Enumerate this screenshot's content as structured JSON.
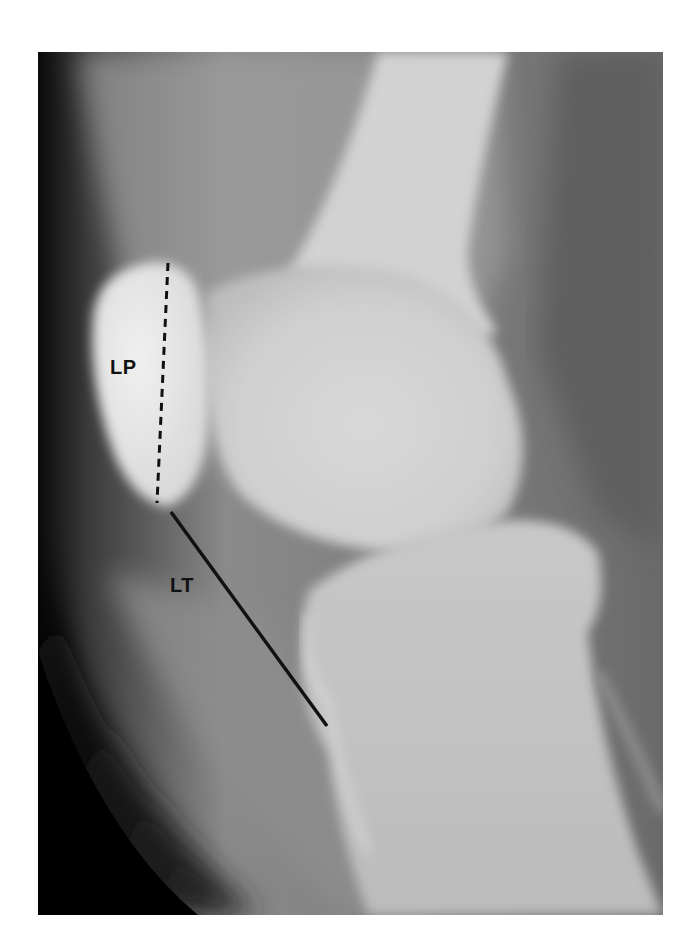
{
  "figure": {
    "type": "lateral knee radiograph",
    "labels": {
      "patella_length": "LP",
      "tendon_length": "LT"
    },
    "lines": {
      "patella_length": {
        "style": "dashed",
        "x1": 168,
        "y1": 263,
        "x2": 157,
        "y2": 503
      },
      "tendon_length": {
        "style": "solid",
        "x1": 171,
        "y1": 512,
        "x2": 327,
        "y2": 726
      }
    },
    "colors": {
      "background": "#ffffff",
      "soft_tissue_dark": "#111111",
      "bone_light": "#e6e6e6",
      "annotation": "#111111"
    }
  }
}
